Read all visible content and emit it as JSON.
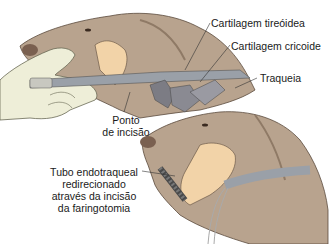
{
  "figure": {
    "labels": {
      "thyroid_cartilage": "Cartilagem tireóidea",
      "cricoid_cartilage": "Cartilagem cricoide",
      "trachea": "Traqueia",
      "incision_point_line1": "Ponto",
      "incision_point_line2": "de incisão",
      "tube_line1": "Tubo endotraqueal",
      "tube_line2": "redirecionado",
      "tube_line3": "através da incisão",
      "tube_line4": "da faringotomia"
    },
    "colors": {
      "dog_fur": "#b8a38e",
      "dog_fur_dark": "#8f7a66",
      "tissue": "#f2d3a8",
      "hand": "#eeeed8",
      "tube": "#9aa0a8",
      "cartilage": "#7c7c84",
      "text": "#1a1a1a",
      "leader": "#333333"
    }
  }
}
